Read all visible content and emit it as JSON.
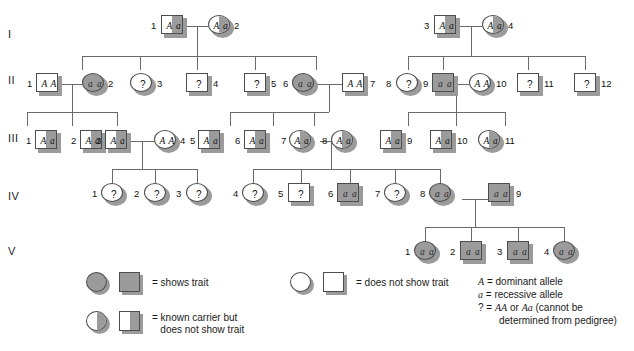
{
  "figure": {
    "type": "pedigree-chart",
    "generation_labels": [
      "I",
      "II",
      "III",
      "IV",
      "V"
    ],
    "colors": {
      "affected_fill": "#9b9b9b",
      "unaffected_fill": "#ffffff",
      "outline": "#4d4d4d",
      "line": "#6a6a6a"
    }
  },
  "generations": {
    "I": [
      {
        "id": "1",
        "sex": "male",
        "status": "carrier",
        "genotype": "Aa"
      },
      {
        "id": "2",
        "sex": "female",
        "status": "carrier",
        "genotype": "Aa"
      },
      {
        "id": "3",
        "sex": "male",
        "status": "carrier",
        "genotype": "Aa"
      },
      {
        "id": "4",
        "sex": "female",
        "status": "carrier",
        "genotype": "Aa"
      }
    ],
    "II": [
      {
        "id": "1",
        "sex": "male",
        "status": "unaffected",
        "genotype": "AA"
      },
      {
        "id": "2",
        "sex": "female",
        "status": "affected",
        "genotype": "aa"
      },
      {
        "id": "3",
        "sex": "female",
        "status": "unaffected",
        "genotype": "?"
      },
      {
        "id": "4",
        "sex": "male",
        "status": "unaffected",
        "genotype": "?"
      },
      {
        "id": "5",
        "sex": "male",
        "status": "unaffected",
        "genotype": "?"
      },
      {
        "id": "6",
        "sex": "female",
        "status": "affected",
        "genotype": "aa"
      },
      {
        "id": "7",
        "sex": "male",
        "status": "unaffected",
        "genotype": "AA"
      },
      {
        "id": "8",
        "sex": "female",
        "status": "unaffected",
        "genotype": "?"
      },
      {
        "id": "9",
        "sex": "male",
        "status": "affected",
        "genotype": "aa"
      },
      {
        "id": "10",
        "sex": "female",
        "status": "unaffected",
        "genotype": "AA"
      },
      {
        "id": "11",
        "sex": "male",
        "status": "unaffected",
        "genotype": "?"
      },
      {
        "id": "12",
        "sex": "male",
        "status": "unaffected",
        "genotype": "?"
      }
    ],
    "III": [
      {
        "id": "1",
        "sex": "male",
        "status": "carrier",
        "genotype": "Aa"
      },
      {
        "id": "2",
        "sex": "male",
        "status": "carrier",
        "genotype": "Aa"
      },
      {
        "id": "3",
        "sex": "male",
        "status": "carrier",
        "genotype": "Aa"
      },
      {
        "id": "4",
        "sex": "female",
        "status": "unaffected",
        "genotype": "AA"
      },
      {
        "id": "5",
        "sex": "male",
        "status": "carrier",
        "genotype": "Aa"
      },
      {
        "id": "6",
        "sex": "male",
        "status": "carrier",
        "genotype": "Aa"
      },
      {
        "id": "7",
        "sex": "female",
        "status": "carrier",
        "genotype": "Aa"
      },
      {
        "id": "8",
        "sex": "female",
        "status": "carrier",
        "genotype": "Aa"
      },
      {
        "id": "9",
        "sex": "male",
        "status": "carrier",
        "genotype": "Aa"
      },
      {
        "id": "10",
        "sex": "male",
        "status": "carrier",
        "genotype": "Aa"
      },
      {
        "id": "11",
        "sex": "female",
        "status": "carrier",
        "genotype": "Aa"
      }
    ],
    "IV": [
      {
        "id": "1",
        "sex": "female",
        "status": "unaffected",
        "genotype": "?"
      },
      {
        "id": "2",
        "sex": "female",
        "status": "unaffected",
        "genotype": "?"
      },
      {
        "id": "3",
        "sex": "female",
        "status": "unaffected",
        "genotype": "?"
      },
      {
        "id": "4",
        "sex": "female",
        "status": "unaffected",
        "genotype": "?"
      },
      {
        "id": "5",
        "sex": "male",
        "status": "unaffected",
        "genotype": "?"
      },
      {
        "id": "6",
        "sex": "male",
        "status": "affected",
        "genotype": "aa"
      },
      {
        "id": "7",
        "sex": "female",
        "status": "unaffected",
        "genotype": "?"
      },
      {
        "id": "8",
        "sex": "female",
        "status": "affected",
        "genotype": "aa"
      },
      {
        "id": "9",
        "sex": "male",
        "status": "affected",
        "genotype": "aa"
      }
    ],
    "V": [
      {
        "id": "1",
        "sex": "female",
        "status": "affected",
        "genotype": "aa"
      },
      {
        "id": "2",
        "sex": "male",
        "status": "affected",
        "genotype": "aa"
      },
      {
        "id": "3",
        "sex": "male",
        "status": "affected",
        "genotype": "aa"
      },
      {
        "id": "4",
        "sex": "female",
        "status": "affected",
        "genotype": "aa"
      }
    ]
  },
  "legend": {
    "shows_trait": "= shows trait",
    "carrier": "= known carrier but",
    "carrier_line2": "   does not show trait",
    "does_not_show": "= does not show trait"
  },
  "key": {
    "dominant_symbol": "A",
    "dominant_text": " = dominant allele",
    "recessive_symbol": "a",
    "recessive_text": " = recessive allele",
    "question_prefix": "? = ",
    "question_g1": "AA",
    "question_or": " or ",
    "question_g2": "Aa",
    "question_tail": " (cannot be",
    "question_line2": "determined from pedigree)"
  }
}
